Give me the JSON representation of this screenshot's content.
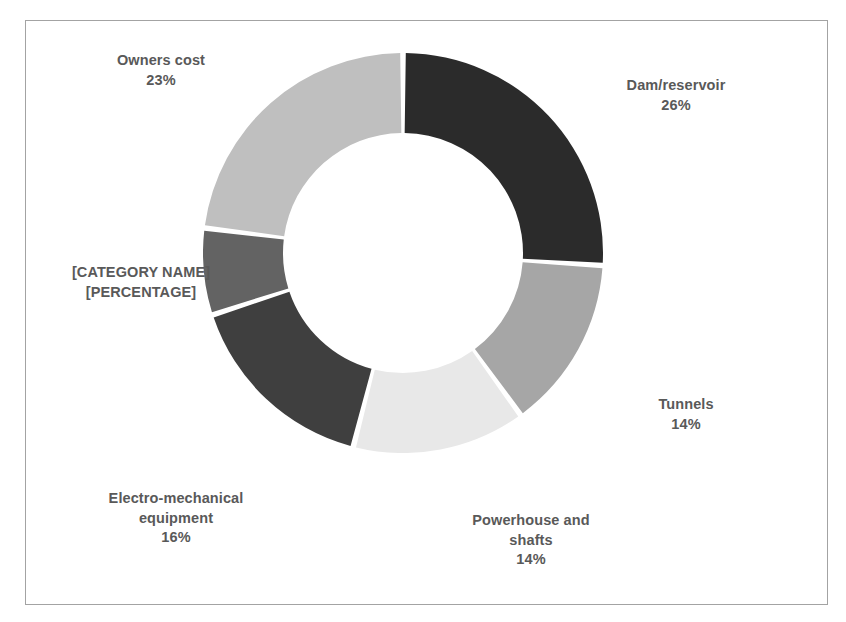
{
  "chart_data": {
    "type": "pie",
    "variant": "doughnut",
    "title": "",
    "subtitle": "",
    "xlabel": "",
    "ylabel": "",
    "legend": "none",
    "grid": false,
    "label_format": "category name + percentage, outside",
    "start_angle_deg": 0,
    "direction": "clockwise",
    "inner_radius_ratio": 0.6,
    "categories": [
      "Dam/reservoir",
      "Tunnels",
      "Powerhouse and shafts",
      "Electro-mechanical equipment",
      "[CATEGORY NAME]",
      "Owners cost"
    ],
    "values": [
      26,
      14,
      14,
      16,
      7,
      23
    ],
    "value_labels": [
      "26%",
      "14%",
      "14%",
      "16%",
      "[PERCENTAGE]",
      "23%"
    ],
    "colors": [
      "#2b2b2b",
      "#a6a6a6",
      "#e8e8e8",
      "#3f3f3f",
      "#636363",
      "#bfbfbf"
    ],
    "units": "percent",
    "total": 100
  },
  "slices": [
    {
      "id": "dam",
      "name": "Dam/reservoir",
      "percent_label": "26%",
      "value": 26,
      "color": "#2b2b2b"
    },
    {
      "id": "tunnels",
      "name": "Tunnels",
      "percent_label": "14%",
      "value": 14,
      "color": "#a6a6a6"
    },
    {
      "id": "powerhouse",
      "name": "Powerhouse and\nshafts",
      "percent_label": "14%",
      "value": 14,
      "color": "#e8e8e8"
    },
    {
      "id": "electro",
      "name": "Electro-mechanical\nequipment",
      "percent_label": "16%",
      "value": 16,
      "color": "#3f3f3f"
    },
    {
      "id": "category",
      "name": "[CATEGORY NAME]",
      "percent_label": "[PERCENTAGE]",
      "value": 7,
      "color": "#636363"
    },
    {
      "id": "owners",
      "name": "Owners cost",
      "percent_label": "23%",
      "value": 23,
      "color": "#bfbfbf"
    }
  ],
  "labels": {
    "owners": "Owners cost\n23%",
    "dam": "Dam/reservoir\n26%",
    "tunnels": "Tunnels\n14%",
    "powerhouse": "Powerhouse and\nshafts\n14%",
    "electro": "Electro-mechanical\nequipment\n16%",
    "category": "[CATEGORY NAME]\n[PERCENTAGE]"
  },
  "style": {
    "text_color": "#595959",
    "background": "#ffffff",
    "border_color": "#a3a3a3",
    "slice_gap_color": "#ffffff"
  }
}
